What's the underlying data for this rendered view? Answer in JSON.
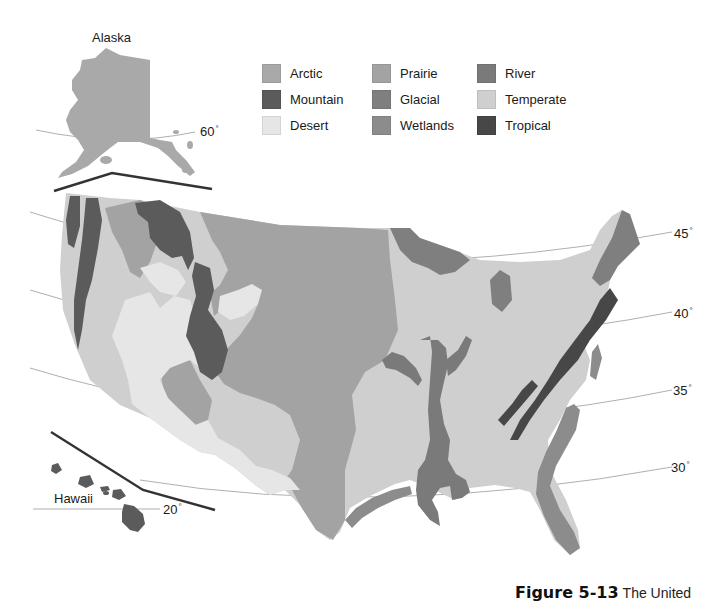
{
  "map": {
    "title": "Biomes of the United States",
    "insets": {
      "alaska": {
        "label": "Alaska",
        "latitude_label": "60",
        "degree_symbol": "°"
      },
      "hawaii": {
        "label": "Hawaii",
        "latitude_label": "20",
        "degree_symbol": "°"
      }
    },
    "latitude_lines": [
      {
        "label": "45",
        "degree_symbol": "°"
      },
      {
        "label": "40",
        "degree_symbol": "°"
      },
      {
        "label": "35",
        "degree_symbol": "°"
      },
      {
        "label": "30",
        "degree_symbol": "°"
      }
    ],
    "legend": {
      "items": [
        {
          "label": "Arctic",
          "color": "#a9a9a9"
        },
        {
          "label": "Mountain",
          "color": "#5b5b5b"
        },
        {
          "label": "Desert",
          "color": "#e6e6e6"
        },
        {
          "label": "Prairie",
          "color": "#a3a3a3"
        },
        {
          "label": "Glacial",
          "color": "#7f7f7f"
        },
        {
          "label": "Wetlands",
          "color": "#8c8c8c"
        },
        {
          "label": "River",
          "color": "#7a7a7a"
        },
        {
          "label": "Temperate",
          "color": "#cfcfcf"
        },
        {
          "label": "Tropical",
          "color": "#474747"
        }
      ]
    },
    "colors": {
      "prairie": "#a3a3a3",
      "temperate": "#cfcfcf",
      "desert": "#e6e6e6",
      "mountain": "#5b5b5b",
      "glacial": "#7f7f7f",
      "river": "#7a7a7a",
      "wetlands": "#8c8c8c",
      "tropical": "#474747",
      "arctic": "#a9a9a9",
      "latitude_line": "#8a8a8a",
      "boundary_line": "#333333"
    }
  },
  "caption": {
    "figure_number": "Figure 5-13",
    "text": "The United"
  }
}
